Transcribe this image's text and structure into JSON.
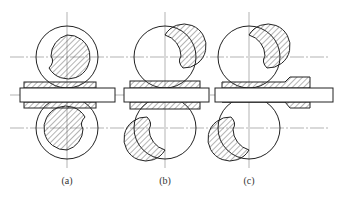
{
  "figure": {
    "panels": [
      {
        "label": "(a)",
        "cx": 67
      },
      {
        "label": "(b)",
        "cx": 165
      },
      {
        "label": "(c)",
        "cx": 249
      }
    ]
  },
  "colors": {
    "line": "#222222",
    "hatch": "#444444",
    "background": "#ffffff"
  }
}
